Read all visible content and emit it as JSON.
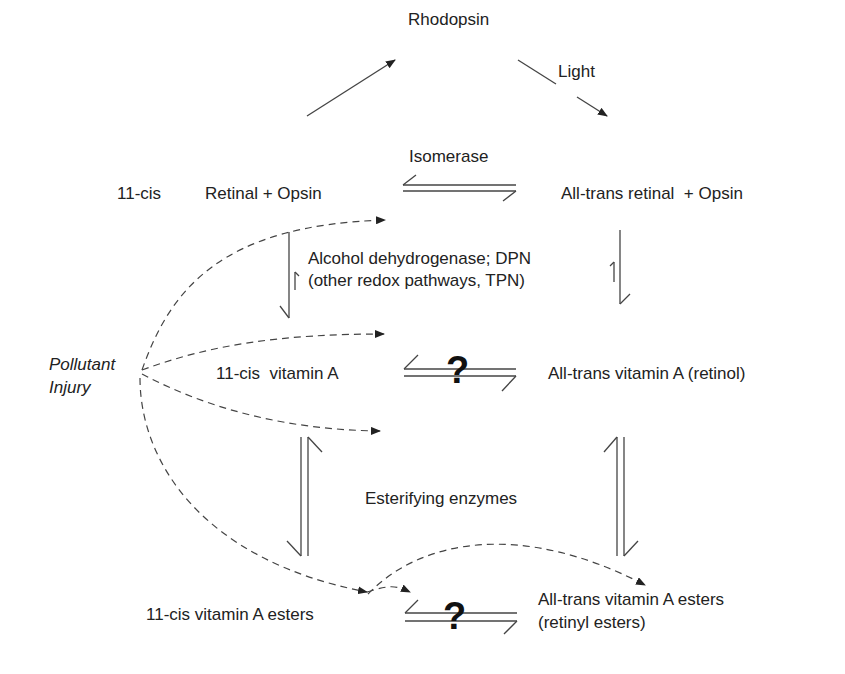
{
  "diagram": {
    "nodes": {
      "rhodopsin": "Rhodopsin",
      "light": "Light",
      "isomerase": "Isomerase",
      "cis_retinal_prefix": "11-cis",
      "cis_retinal": "Retinal + Opsin",
      "trans_retinal": "All-trans retinal  + Opsin",
      "enzyme_line1": "Alcohol dehydrogenase; DPN",
      "enzyme_line2": "(other redox pathways, TPN)",
      "pollutant_line1": "Pollutant",
      "pollutant_line2": "Injury",
      "cis_vitA": "11-cis  vitamin A",
      "trans_vitA": "All-trans vitamin A (retinol)",
      "esterifying": "Esterifying enzymes",
      "cis_esters": "11-cis vitamin A esters",
      "trans_esters_line1": "All-trans vitamin A esters",
      "trans_esters_line2": "(retinyl esters)",
      "unknown_1": "?",
      "unknown_2": "?"
    },
    "edges": [
      {
        "from": "11-cis Retinal + Opsin",
        "to": "Rhodopsin",
        "type": "arrow"
      },
      {
        "from": "Rhodopsin",
        "to": "All-trans retinal + Opsin",
        "type": "arrow",
        "label": "Light"
      },
      {
        "from": "11-cis Retinal + Opsin",
        "to": "All-trans retinal + Opsin",
        "type": "equilibrium",
        "label": "Isomerase"
      },
      {
        "from": "11-cis Retinal + Opsin",
        "to": "11-cis vitamin A",
        "type": "equilibrium"
      },
      {
        "from": "All-trans retinal + Opsin",
        "to": "All-trans vitamin A (retinol)",
        "type": "equilibrium"
      },
      {
        "from": "11-cis vitamin A",
        "to": "All-trans vitamin A (retinol)",
        "type": "equilibrium",
        "label": "?"
      },
      {
        "from": "11-cis vitamin A",
        "to": "11-cis vitamin A esters",
        "type": "equilibrium"
      },
      {
        "from": "All-trans vitamin A (retinol)",
        "to": "All-trans vitamin A esters",
        "type": "equilibrium"
      },
      {
        "from": "11-cis vitamin A esters",
        "to": "All-trans vitamin A esters",
        "type": "equilibrium",
        "label": "?"
      },
      {
        "from": "Pollutant Injury",
        "to": "isomerase step",
        "type": "dashed-arrow"
      },
      {
        "from": "Pollutant Injury",
        "to": "cis-trans vitamin A step",
        "type": "dashed-arrow"
      },
      {
        "from": "Pollutant Injury",
        "to": "esterification step",
        "type": "dashed-arrow"
      },
      {
        "from": "Pollutant Injury",
        "to": "cis esters",
        "type": "dashed-arrow"
      }
    ]
  }
}
